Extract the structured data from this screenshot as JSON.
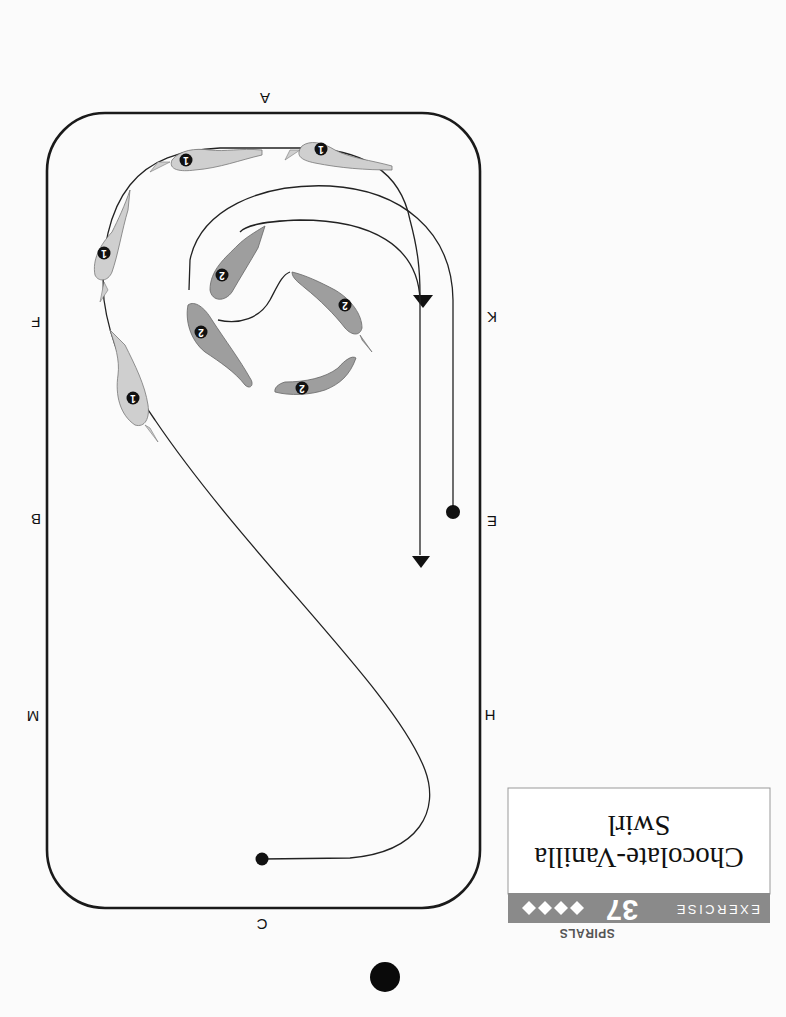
{
  "page": {
    "orientation": "rotated 180 degrees",
    "background": "#fbfbfb"
  },
  "header": {
    "chapter": "SPIRALS",
    "exercise_label": "EXERCISE",
    "exercise_number": "37",
    "difficulty_icon": "diamond-icon",
    "difficulty_count": 4,
    "difficulty_symbols": "♦♦♦♦",
    "title_line1": "Chocolate-Vanilla",
    "title_line2": "Swirl",
    "bar_color": "#8a8a8a"
  },
  "arena": {
    "letters": {
      "top": "A",
      "right_upper": "K",
      "right_middle": "E",
      "right_lower": "H",
      "bottom": "C",
      "left_lower": "M",
      "left_middle": "B",
      "left_upper": "F"
    }
  },
  "riders": {
    "rider1": {
      "label": "1",
      "color": "#cfcfcf",
      "count": 5
    },
    "rider2": {
      "label": "2",
      "color": "#9e9e9e",
      "count": 5
    }
  },
  "markers": {
    "start_dot": "circle",
    "end_arrow": "triangle"
  },
  "page_marker": "black-dot"
}
